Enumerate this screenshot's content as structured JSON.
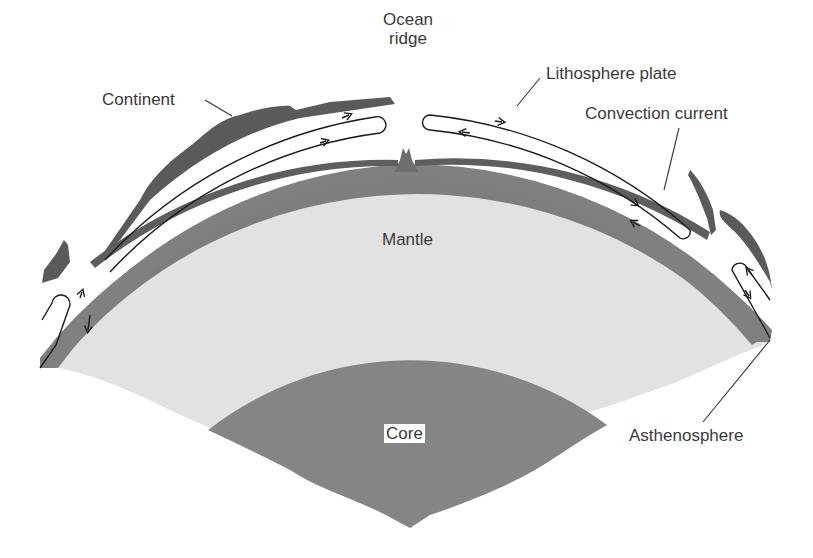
{
  "diagram": {
    "colors": {
      "background": "#ffffff",
      "lithosphere": "#6a6a6a",
      "asthenosphere": "#818181",
      "mantle": "#e2e2e2",
      "core": "#858585",
      "label_text": "#3a3a3a",
      "leader_line": "#333333"
    },
    "labels": {
      "ocean_ridge": "Ocean\nridge",
      "ocean_ridge_line1": "Ocean",
      "ocean_ridge_line2": "ridge",
      "continent": "Continent",
      "lithosphere_plate": "Lithosphere plate",
      "convection_current": "Convection current",
      "mantle": "Mantle",
      "core": "Core",
      "asthenosphere": "Asthenosphere"
    },
    "layers": [
      "Lithosphere plate",
      "Asthenosphere",
      "Mantle",
      "Core"
    ],
    "features": [
      "Ocean ridge",
      "Continent",
      "Convection current"
    ]
  }
}
